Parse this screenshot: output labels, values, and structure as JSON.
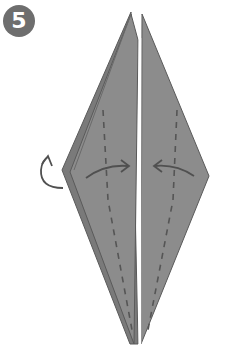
{
  "step": {
    "number": "5"
  },
  "colors": {
    "paper": "#8a8a8a",
    "paper_dark": "#7a7a7a",
    "outline": "#5a5a5a",
    "fold_line": "#555555",
    "arrow": "#505050",
    "badge": "#6e6e6e"
  },
  "diagram": {
    "icons": [
      "fold-arrow-right",
      "fold-arrow-left",
      "turn-over-arrow"
    ]
  }
}
